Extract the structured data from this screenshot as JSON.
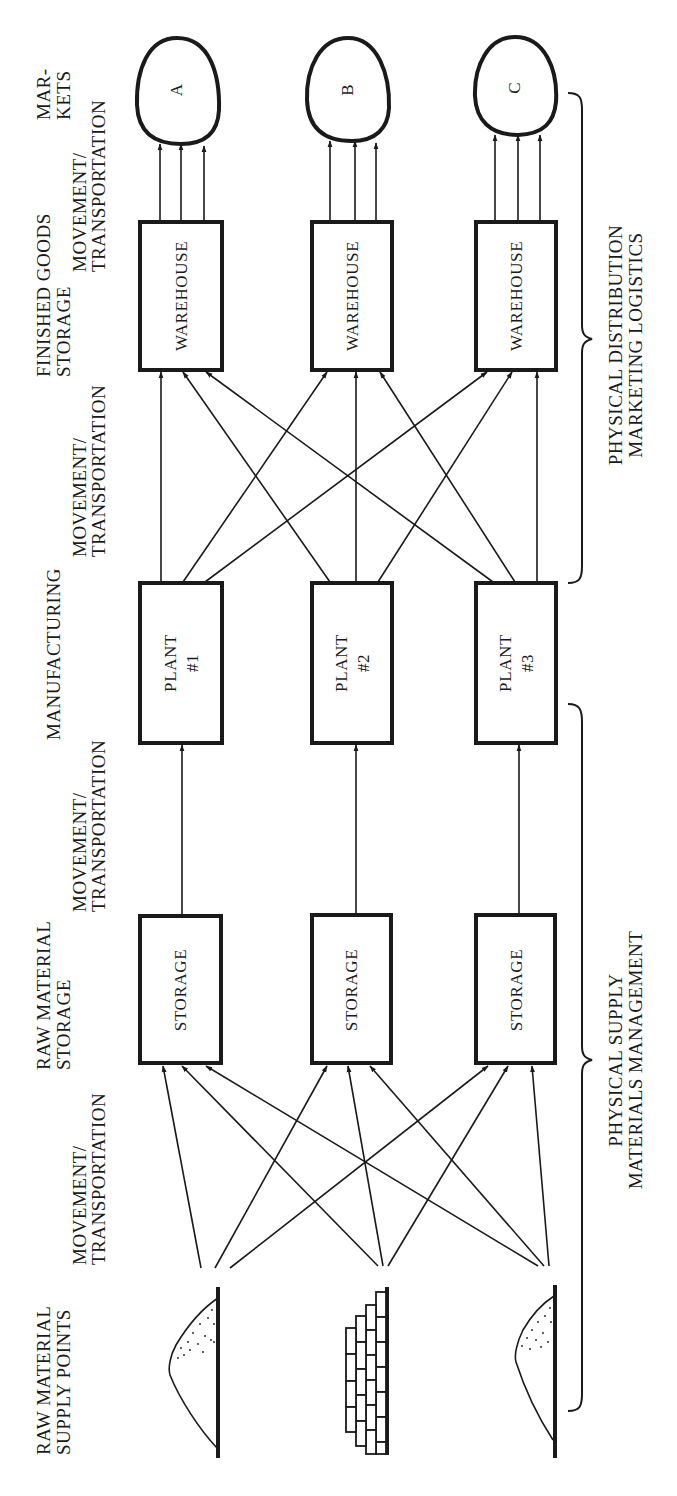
{
  "stages": {
    "supply_points": {
      "line1": "RAW MATERIAL",
      "line2": "SUPPLY POINTS"
    },
    "move1": {
      "line1": "MOVEMENT/",
      "line2": "TRANSPORTATION"
    },
    "raw_storage": {
      "line1": "RAW MATERIAL",
      "line2": "STORAGE"
    },
    "move2": {
      "line1": "MOVEMENT/",
      "line2": "TRANSPORTATION"
    },
    "manufacturing": {
      "line1": "MANUFACTURING"
    },
    "move3": {
      "line1": "MOVEMENT/",
      "line2": "TRANSPORTATION"
    },
    "finished_storage": {
      "line1": "FINISHED GOODS",
      "line2": "STORAGE"
    },
    "move4": {
      "line1": "MOVEMENT/",
      "line2": "TRANSPORTATION"
    },
    "markets": {
      "line1": "MAR-",
      "line2": "KETS"
    }
  },
  "supply_points": [
    {
      "type": "pile",
      "icon": "dotted-mound"
    },
    {
      "type": "stack",
      "icon": "brick-stack"
    },
    {
      "type": "pile",
      "icon": "dotted-mound"
    }
  ],
  "storage": [
    {
      "label": "STORAGE"
    },
    {
      "label": "STORAGE"
    },
    {
      "label": "STORAGE"
    }
  ],
  "plants": [
    {
      "line1": "PLANT",
      "line2": "#1"
    },
    {
      "line1": "PLANT",
      "line2": "#2"
    },
    {
      "line1": "PLANT",
      "line2": "#3"
    }
  ],
  "warehouses": [
    {
      "label": "WAREHOUSE"
    },
    {
      "label": "WAREHOUSE"
    },
    {
      "label": "WAREHOUSE"
    }
  ],
  "markets": [
    {
      "label": "A"
    },
    {
      "label": "B"
    },
    {
      "label": "C"
    }
  ],
  "braces": {
    "physical_distribution": {
      "line1": "PHYSICAL  DISTRIBUTION",
      "line2": "MARKETING  LOGISTICS"
    },
    "physical_supply": {
      "line1": "PHYSICAL  SUPPLY",
      "line2": "MATERIALS  MANAGEMENT"
    }
  },
  "flows": {
    "supply_to_storage": "each supply point connects to all three storage sites",
    "storage_to_plant": "one-to-one",
    "plant_to_warehouse": "each plant connects to all three warehouses",
    "warehouse_to_market": "three arrows per warehouse to its market"
  },
  "colors": {
    "ink": "#1a1a1a",
    "paper": "#ffffff"
  }
}
